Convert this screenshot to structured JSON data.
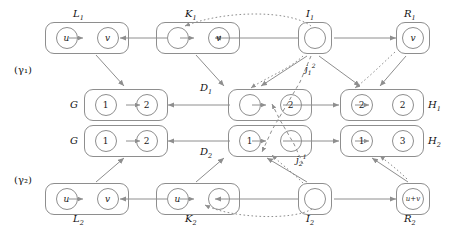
{
  "diagram": {
    "stroke_color": "#8e8e8e",
    "text_color": "#111111",
    "row_labels": [
      {
        "id": "gamma1",
        "text": "(γ₁)"
      },
      {
        "id": "gamma2",
        "text": "(γ₂)"
      }
    ],
    "objects": [
      {
        "id": "L1",
        "label": "L",
        "sub": "1",
        "nodes": [
          "u",
          "v"
        ],
        "kind": "pair"
      },
      {
        "id": "K1",
        "label": "K",
        "sub": "1",
        "nodes": [
          "",
          "v"
        ],
        "kind": "pair"
      },
      {
        "id": "I1",
        "label": "I",
        "sub": "1",
        "nodes": [
          ""
        ],
        "kind": "small"
      },
      {
        "id": "R1",
        "label": "R",
        "sub": "1",
        "nodes": [
          "v"
        ],
        "kind": "small"
      },
      {
        "id": "G1",
        "label": "G",
        "sub": "",
        "nodes": [
          "1",
          "2"
        ],
        "kind": "pair"
      },
      {
        "id": "D1",
        "label": "D",
        "sub": "1",
        "nodes": [
          "",
          "2"
        ],
        "kind": "pair"
      },
      {
        "id": "H1",
        "label": "H",
        "sub": "1",
        "nodes": [
          "2",
          "2"
        ],
        "kind": "pair"
      },
      {
        "id": "G2",
        "label": "G",
        "sub": "",
        "nodes": [
          "1",
          "2"
        ],
        "kind": "pair"
      },
      {
        "id": "D2",
        "label": "D",
        "sub": "2",
        "nodes": [
          "1",
          ""
        ],
        "kind": "pair"
      },
      {
        "id": "H2",
        "label": "H",
        "sub": "2",
        "nodes": [
          "1",
          "3"
        ],
        "kind": "pair"
      },
      {
        "id": "L2",
        "label": "L",
        "sub": "2",
        "nodes": [
          "u",
          "v"
        ],
        "kind": "pair"
      },
      {
        "id": "K2",
        "label": "K",
        "sub": "2",
        "nodes": [
          "u",
          ""
        ],
        "kind": "pair"
      },
      {
        "id": "I2",
        "label": "I",
        "sub": "2",
        "nodes": [
          ""
        ],
        "kind": "small"
      },
      {
        "id": "R2",
        "label": "R",
        "sub": "2",
        "nodes": [
          "u+v"
        ],
        "kind": "small"
      }
    ],
    "morphism_labels": [
      {
        "id": "j12",
        "base": "j",
        "sub": "1",
        "sup": "2"
      },
      {
        "id": "j21",
        "base": "j",
        "sub": "2",
        "sup": "1"
      }
    ]
  }
}
